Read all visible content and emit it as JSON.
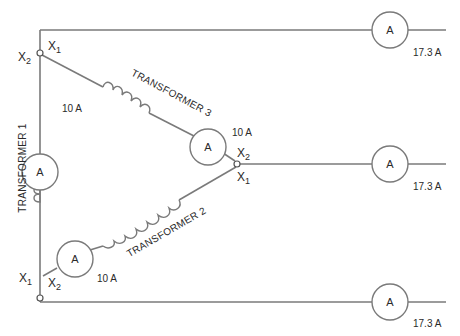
{
  "diagram": {
    "colors": {
      "wire": "#7a7a7a",
      "text": "#2a2a2a",
      "background": "#ffffff"
    },
    "transformers": [
      {
        "id": "t1",
        "label": "TRANSFORMER 1"
      },
      {
        "id": "t2",
        "label": "TRANSFORMER 2"
      },
      {
        "id": "t3",
        "label": "TRANSFORMER 3"
      }
    ],
    "meters": {
      "symbol": "A",
      "phase": [
        {
          "id": "m_t1",
          "reading": "10 A"
        },
        {
          "id": "m_t3",
          "reading": "10 A"
        },
        {
          "id": "m_t2",
          "reading": "10 A"
        }
      ],
      "line": [
        {
          "id": "m_l1",
          "reading": "17.3 A"
        },
        {
          "id": "m_l2",
          "reading": "17.3 A"
        },
        {
          "id": "m_l3",
          "reading": "17.3 A"
        }
      ]
    },
    "terminals": {
      "top_x1": {
        "base": "X",
        "sub": "1"
      },
      "top_x2": {
        "base": "X",
        "sub": "2"
      },
      "right_x2": {
        "base": "X",
        "sub": "2"
      },
      "right_x1": {
        "base": "X",
        "sub": "1"
      },
      "bottom_x1": {
        "base": "X",
        "sub": "1"
      },
      "bottom_x2": {
        "base": "X",
        "sub": "2"
      }
    }
  }
}
